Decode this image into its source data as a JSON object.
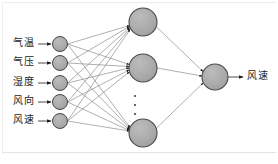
{
  "figure": {
    "kind": "neural-network-diagram",
    "colors": {
      "node_fill": "#a9a9a9",
      "node_stroke": "#4a4a4a",
      "edge": "#777777",
      "arrow": "#1a1a1a",
      "text": "#1c1c1c",
      "background": "#ffffff",
      "frame": "#ececec"
    }
  },
  "input_layer": {
    "name": "输入层",
    "count": 5,
    "nodes": [
      {
        "label": "气温",
        "cx": 60,
        "cy": 44,
        "r": 7.5,
        "label_x": 13,
        "label_y": 39
      },
      {
        "label": "气压",
        "cx": 60,
        "cy": 63,
        "r": 7.5,
        "label_x": 13,
        "label_y": 58
      },
      {
        "label": "湿度",
        "cx": 60,
        "cy": 83,
        "r": 7.5,
        "label_x": 13,
        "label_y": 78
      },
      {
        "label": "风向",
        "cx": 60,
        "cy": 102,
        "r": 7.5,
        "label_x": 13,
        "label_y": 97
      },
      {
        "label": "风速",
        "cx": 60,
        "cy": 121,
        "r": 7.5,
        "label_x": 13,
        "label_y": 116
      }
    ]
  },
  "hidden_layer": {
    "name": "隐含层",
    "visible_count": 3,
    "has_ellipsis": true,
    "ellipsis_glyph": "⋮",
    "nodes": [
      {
        "id": "h1",
        "cx": 143,
        "cy": 22,
        "r": 14
      },
      {
        "id": "h2",
        "cx": 143,
        "cy": 68,
        "r": 14
      },
      {
        "id": "h3",
        "cx": 143,
        "cy": 133,
        "r": 14
      }
    ]
  },
  "output_layer": {
    "name": "输出层",
    "count": 1,
    "nodes": [
      {
        "label": "风速",
        "cx": 215,
        "cy": 77,
        "r": 13,
        "label_x": 247,
        "label_y": 72
      }
    ]
  },
  "edges": {
    "input_to_hidden": "fully-connected 5x3",
    "hidden_to_output": "fully-connected 3x1",
    "input_arrows": 5,
    "output_arrow": 1
  }
}
